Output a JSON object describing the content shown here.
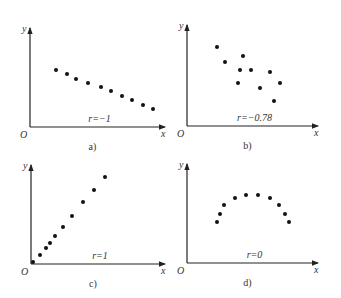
{
  "chart_data": [
    {
      "type": "scatter",
      "panel": "a)",
      "annotation": "r=−1",
      "xlabel": "x",
      "ylabel": "y",
      "origin_label": "O",
      "points_px": [
        [
          56,
          70
        ],
        [
          67,
          74
        ],
        [
          76,
          79
        ],
        [
          88,
          83
        ],
        [
          101,
          87
        ],
        [
          111,
          91
        ],
        [
          122,
          96
        ],
        [
          132,
          100
        ],
        [
          143,
          105
        ],
        [
          153,
          109
        ]
      ],
      "axes_px": {
        "ox": 30,
        "oy": 127,
        "xend": 165,
        "ytop": 28
      }
    },
    {
      "type": "scatter",
      "panel": "b)",
      "annotation": "r=−0.78",
      "xlabel": "x",
      "ylabel": "y",
      "origin_label": "O",
      "points_px": [
        [
          217,
          47
        ],
        [
          225,
          62
        ],
        [
          243,
          56
        ],
        [
          240,
          70
        ],
        [
          251,
          70
        ],
        [
          238,
          83
        ],
        [
          260,
          88
        ],
        [
          270,
          72
        ],
        [
          280,
          83
        ],
        [
          274,
          101
        ]
      ],
      "axes_px": {
        "ox": 187,
        "oy": 126,
        "xend": 318,
        "ytop": 25
      }
    },
    {
      "type": "scatter",
      "panel": "c)",
      "annotation": "r=1",
      "xlabel": "x",
      "ylabel": "y",
      "origin_label": "O",
      "points_px": [
        [
          33,
          262
        ],
        [
          40,
          255
        ],
        [
          46,
          248
        ],
        [
          50,
          243
        ],
        [
          55,
          236
        ],
        [
          63,
          227
        ],
        [
          72,
          216
        ],
        [
          83,
          202
        ],
        [
          94,
          190
        ],
        [
          105,
          177
        ]
      ],
      "axes_px": {
        "ox": 31,
        "oy": 264,
        "xend": 165,
        "ytop": 165
      }
    },
    {
      "type": "scatter",
      "panel": "d)",
      "annotation": "r=0",
      "xlabel": "x",
      "ylabel": "y",
      "origin_label": "O",
      "points_px": [
        [
          217,
          222
        ],
        [
          220,
          214
        ],
        [
          224,
          205
        ],
        [
          235,
          198
        ],
        [
          246,
          195
        ],
        [
          258,
          195
        ],
        [
          270,
          198
        ],
        [
          279,
          205
        ],
        [
          285,
          214
        ],
        [
          289,
          222
        ]
      ],
      "axes_px": {
        "ox": 187,
        "oy": 263,
        "xend": 318,
        "ytop": 164
      }
    }
  ],
  "panels": {
    "a": {
      "caption": "a)",
      "r": "r=−1",
      "x": "x",
      "y": "y",
      "o": "O"
    },
    "b": {
      "caption": "b)",
      "r": "r=−0.78",
      "x": "x",
      "y": "y",
      "o": "O"
    },
    "c": {
      "caption": "c)",
      "r": "r=1",
      "x": "x",
      "y": "y",
      "o": "O"
    },
    "d": {
      "caption": "d)",
      "r": "r=0",
      "x": "x",
      "y": "y",
      "o": "O"
    }
  }
}
